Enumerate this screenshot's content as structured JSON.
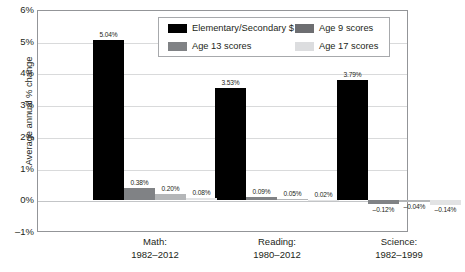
{
  "chart_data": {
    "type": "bar",
    "title": "",
    "xlabel": "",
    "ylabel": "Average annual % change",
    "ylim": [
      -1,
      6
    ],
    "ytick_labels": [
      "6%",
      "5%",
      "4%",
      "3%",
      "2%",
      "1%",
      "0%",
      "–1%"
    ],
    "ytick_values": [
      6,
      5,
      4,
      3,
      2,
      1,
      0,
      -1
    ],
    "grid": true,
    "legend_position": "top-center-inside",
    "categories": [
      "Math:\n1982–2012",
      "Reading:\n1980–2012",
      "Science:\n1982–1999"
    ],
    "category_labels": [
      {
        "line1": "Math:",
        "line2": "1982–2012"
      },
      {
        "line1": "Reading:",
        "line2": "1980–2012"
      },
      {
        "line1": "Science:",
        "line2": "1982–1999"
      }
    ],
    "series": [
      {
        "name": "Elementary/Secondary $",
        "color": "#000000",
        "values": [
          5.04,
          3.53,
          3.79
        ],
        "labels": [
          "5.04%",
          "3.53%",
          "3.79%"
        ]
      },
      {
        "name": "Age 9 scores",
        "color": "#6d6e71",
        "values": [
          0.38,
          0.09,
          -0.12
        ],
        "labels": [
          "0.38%",
          "0.09%",
          "–0.12%"
        ]
      },
      {
        "name": "Age 13 scores",
        "color": "#808285",
        "values": [
          0.2,
          0.05,
          -0.04
        ],
        "labels": [
          "0.20%",
          "0.05%",
          "–0.04%"
        ]
      },
      {
        "name": "Age 17 scores",
        "color": "#dcdddf",
        "values": [
          0.08,
          0.02,
          -0.14
        ],
        "labels": [
          "0.08%",
          "0.02%",
          "–0.14%"
        ]
      }
    ]
  },
  "legend": {
    "entries": [
      {
        "label": "Elementary/Secondary $",
        "swatch": "black"
      },
      {
        "label": "Age 9 scores",
        "swatch": "dark-gray"
      },
      {
        "label": "Age 13 scores",
        "swatch": "medium-gray"
      },
      {
        "label": "Age 17 scores",
        "swatch": "light-gray"
      }
    ]
  }
}
